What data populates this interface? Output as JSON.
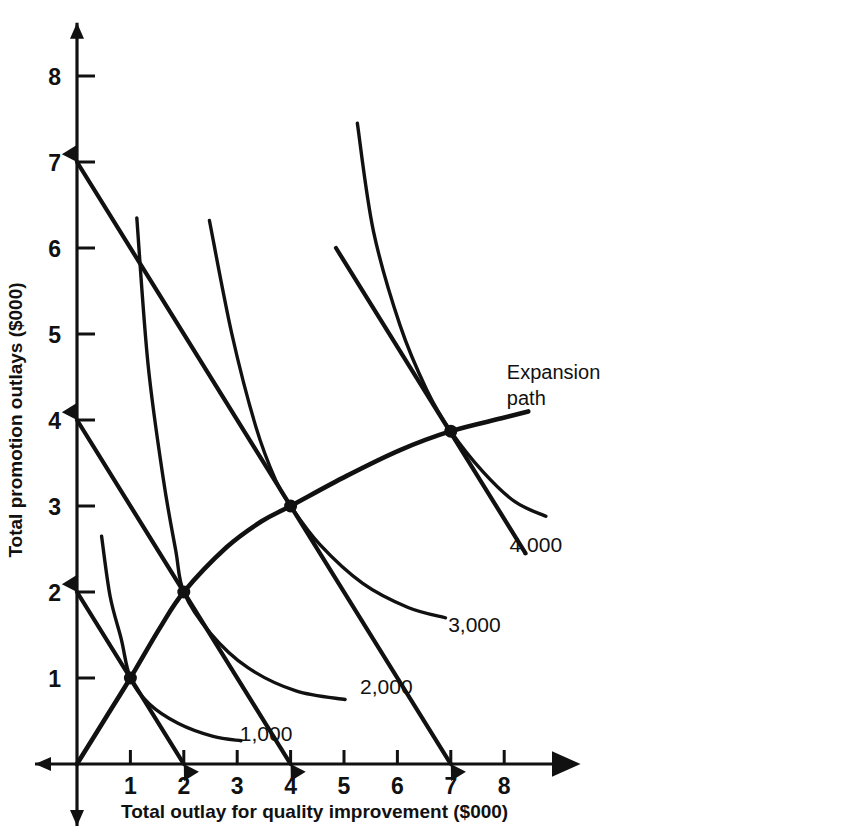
{
  "chart_data": {
    "type": "line",
    "title": "",
    "xlabel": "Total outlay for quality improvement ($000)",
    "ylabel": "Total promotion outlays ($000)",
    "xlim": [
      0,
      8.8
    ],
    "ylim": [
      0,
      8.6
    ],
    "xticks": [
      1,
      2,
      3,
      4,
      5,
      6,
      7,
      8
    ],
    "yticks": [
      1,
      2,
      3,
      4,
      5,
      6,
      7,
      8
    ],
    "xtick_labels": [
      "1",
      "2",
      "3",
      "4",
      "5",
      "6",
      "7",
      "8"
    ],
    "ytick_labels": [
      "1",
      "2",
      "3",
      "4",
      "5",
      "6",
      "7",
      "8"
    ],
    "grid": false,
    "legend": "inline-curve-labels",
    "series": [
      {
        "name": "1,000",
        "kind": "isoquant",
        "label": "1,000",
        "label_x": 3.05,
        "label_y": 0.35,
        "points": [
          [
            0.46,
            2.65
          ],
          [
            0.62,
            1.95
          ],
          [
            0.83,
            1.45
          ],
          [
            1.0,
            1.0
          ],
          [
            1.35,
            0.7
          ],
          [
            1.9,
            0.47
          ],
          [
            2.55,
            0.32
          ],
          [
            3.07,
            0.27
          ]
        ]
      },
      {
        "name": "2,000",
        "kind": "isoquant",
        "label": "2,000",
        "label_x": 5.3,
        "label_y": 0.9,
        "points": [
          [
            1.12,
            6.35
          ],
          [
            1.33,
            4.65
          ],
          [
            1.62,
            3.3
          ],
          [
            1.85,
            2.48
          ],
          [
            2.0,
            2.0
          ],
          [
            2.5,
            1.52
          ],
          [
            3.2,
            1.12
          ],
          [
            4.1,
            0.85
          ],
          [
            5.02,
            0.75
          ]
        ]
      },
      {
        "name": "3,000",
        "kind": "isoquant",
        "label": "3,000",
        "label_x": 6.95,
        "label_y": 1.62,
        "points": [
          [
            2.48,
            6.32
          ],
          [
            2.9,
            5.0
          ],
          [
            3.35,
            3.92
          ],
          [
            3.72,
            3.3
          ],
          [
            4.0,
            3.0
          ],
          [
            4.55,
            2.55
          ],
          [
            5.35,
            2.1
          ],
          [
            6.2,
            1.82
          ],
          [
            6.9,
            1.7
          ]
        ]
      },
      {
        "name": "4,000",
        "kind": "isoquant",
        "label": "4,000",
        "label_x": 8.1,
        "label_y": 2.55,
        "points": [
          [
            5.25,
            7.45
          ],
          [
            5.55,
            6.2
          ],
          [
            6.05,
            5.1
          ],
          [
            6.55,
            4.35
          ],
          [
            7.0,
            3.87
          ],
          [
            7.6,
            3.4
          ],
          [
            8.2,
            3.05
          ],
          [
            8.78,
            2.88
          ]
        ]
      }
    ],
    "budget_lines": [
      {
        "name": "budget-1000",
        "from": [
          0,
          2
        ],
        "to": [
          2,
          0
        ]
      },
      {
        "name": "budget-2000",
        "from": [
          0,
          4
        ],
        "to": [
          4,
          0
        ]
      },
      {
        "name": "budget-3000",
        "from": [
          0,
          7
        ],
        "to": [
          7,
          0
        ]
      },
      {
        "name": "budget-4000",
        "from": [
          4.85,
          6.0
        ],
        "to": [
          8.4,
          2.45
        ]
      }
    ],
    "expansion_path": {
      "label": "Expansion\npath",
      "label_line1": "Expansion",
      "label_line2": "path",
      "label_x": 8.05,
      "label_y": 4.55,
      "points": [
        [
          0,
          0
        ],
        [
          0.55,
          0.55
        ],
        [
          1.0,
          1.0
        ],
        [
          1.55,
          1.58
        ],
        [
          2.0,
          2.0
        ],
        [
          2.8,
          2.52
        ],
        [
          3.45,
          2.82
        ],
        [
          4.0,
          3.0
        ],
        [
          5.05,
          3.35
        ],
        [
          6.05,
          3.65
        ],
        [
          7.0,
          3.87
        ],
        [
          7.95,
          4.02
        ],
        [
          8.45,
          4.1
        ]
      ]
    },
    "tangency_points": [
      {
        "x": 1,
        "y": 1
      },
      {
        "x": 2,
        "y": 2
      },
      {
        "x": 4,
        "y": 3
      },
      {
        "x": 7,
        "y": 3.87
      }
    ]
  }
}
